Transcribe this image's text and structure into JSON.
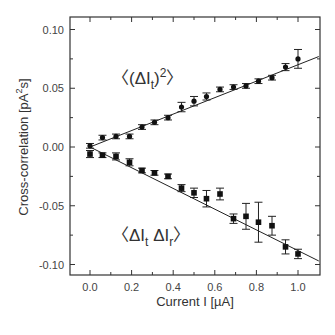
{
  "chart_data": {
    "type": "scatter",
    "title": "",
    "xlabel": "Current  I  [µA]",
    "ylabel": "Cross-correlation  [pA²s]",
    "xlim": [
      -0.1,
      1.1
    ],
    "ylim": [
      -0.11,
      0.11
    ],
    "x_ticks": [
      0.0,
      0.2,
      0.4,
      0.6,
      0.8,
      1.0
    ],
    "x_tick_labels": [
      "0.0",
      "0.2",
      "0.4",
      "0.6",
      "0.8",
      "1.0"
    ],
    "y_ticks": [
      -0.1,
      -0.05,
      0.0,
      0.05,
      0.1
    ],
    "y_tick_labels": [
      "-0.10",
      "-0.05",
      "0.00",
      "0.05",
      "0.10"
    ],
    "grid": false,
    "legend": "none (inline annotations)",
    "series": [
      {
        "name": "⟨(ΔI_t)²⟩",
        "marker": "circle",
        "x": [
          0.0,
          0.06,
          0.125,
          0.19,
          0.25,
          0.31,
          0.375,
          0.44,
          0.5,
          0.56,
          0.625,
          0.69,
          0.75,
          0.81,
          0.875,
          0.94,
          1.0
        ],
        "y": [
          0.001,
          0.008,
          0.009,
          0.009,
          0.017,
          0.021,
          0.025,
          0.034,
          0.039,
          0.043,
          0.049,
          0.051,
          0.052,
          0.056,
          0.059,
          0.068,
          0.075
        ],
        "err": [
          0.002,
          0.002,
          0.002,
          0.002,
          0.002,
          0.002,
          0.002,
          0.004,
          0.004,
          0.003,
          0.002,
          0.002,
          0.002,
          0.002,
          0.002,
          0.003,
          0.008
        ],
        "fit": {
          "x": [
            0.0,
            1.1
          ],
          "y": [
            0.0,
            0.077
          ]
        }
      },
      {
        "name": "⟨ΔI_t ΔI_r⟩",
        "marker": "square",
        "x": [
          0.0,
          0.06,
          0.125,
          0.19,
          0.25,
          0.31,
          0.375,
          0.44,
          0.5,
          0.56,
          0.625,
          0.69,
          0.75,
          0.81,
          0.875,
          0.94,
          1.0
        ],
        "y": [
          -0.006,
          -0.007,
          -0.008,
          -0.013,
          -0.02,
          -0.022,
          -0.025,
          -0.035,
          -0.039,
          -0.044,
          -0.04,
          -0.061,
          -0.059,
          -0.064,
          -0.067,
          -0.085,
          -0.091
        ],
        "err": [
          0.003,
          0.002,
          0.003,
          0.003,
          0.002,
          0.002,
          0.002,
          0.003,
          0.004,
          0.007,
          0.005,
          0.004,
          0.011,
          0.017,
          0.008,
          0.006,
          0.004
        ],
        "fit": {
          "x": [
            0.0,
            1.1
          ],
          "y": [
            0.0,
            -0.097
          ]
        }
      }
    ],
    "annotations": [
      {
        "text": "⟨(ΔI_t)²⟩",
        "near_series": 0
      },
      {
        "text": "⟨ΔI_t ΔI_r⟩",
        "near_series": 1
      }
    ]
  },
  "labels": {
    "ylabel_main": "Cross-correlation  [pA",
    "ylabel_sup": "2",
    "ylabel_end": "s]",
    "xlabel": "Current  I  [µA]",
    "annot_upper": {
      "pre": "〈(ΔI",
      "sub": "t",
      "mid": ")",
      "sup": "2",
      "post": "〉"
    },
    "annot_lower": {
      "pre": "〈ΔI",
      "sub1": "t",
      "mid": " ΔI",
      "sub2": "r",
      "post": "〉"
    }
  }
}
